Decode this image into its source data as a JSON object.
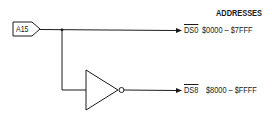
{
  "diagram": {
    "header": "ADDRESSES",
    "input": {
      "label": "A15"
    },
    "outputs": [
      {
        "signal": "DS0",
        "range": "$0000 – $7FFF",
        "via_inverter": false
      },
      {
        "signal": "DS8",
        "range": "$8000 – $FFFF",
        "via_inverter": true
      }
    ],
    "colors": {
      "line": "#1a1a1a",
      "background": "#ffffff"
    }
  }
}
